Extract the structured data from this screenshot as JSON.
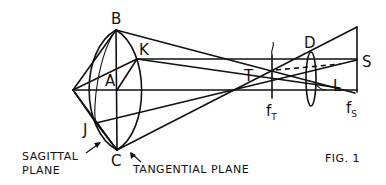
{
  "figure": {
    "caption": "FIG. 1",
    "points": {
      "B": "B",
      "K": "K",
      "A": "A",
      "J": "J",
      "C": "C",
      "T": "T",
      "D": "D",
      "S": "S",
      "L": "L"
    },
    "focal_labels": {
      "fT_main": "f",
      "fT_sub": "T",
      "fS_main": "f",
      "fS_sub": "S"
    },
    "annotations": {
      "sagittal_line1": "SAGITTAL",
      "sagittal_line2": "PLANE",
      "tangential": "TANGENTIAL PLANE"
    }
  }
}
